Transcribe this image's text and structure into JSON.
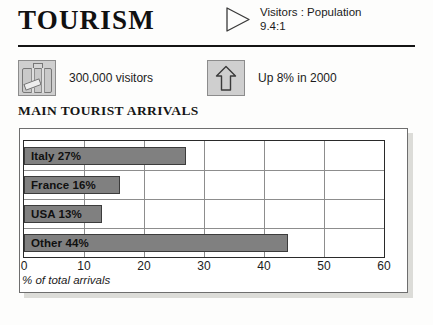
{
  "header": {
    "title": "TOURISM",
    "triangle_icon": "triangle-right-icon",
    "ratio_line1": "Visitors : Population",
    "ratio_line2": "9.4:1"
  },
  "stats": [
    {
      "icon": "suitcase-icon",
      "label": "300,000 visitors"
    },
    {
      "icon": "up-arrow-icon",
      "label": "Up 8% in 2000"
    }
  ],
  "chart_heading": "MAIN TOURIST ARRIVALS",
  "chart_data": {
    "type": "bar",
    "orientation": "horizontal",
    "title": "MAIN TOURIST ARRIVALS",
    "categories": [
      "Italy",
      "France",
      "USA",
      "Other"
    ],
    "values": [
      27,
      16,
      13,
      44
    ],
    "bar_labels": [
      "Italy 27%",
      "France 16%",
      "USA 13%",
      "Other 44%"
    ],
    "xlabel": "% of total arrivals",
    "ylabel": "",
    "xlim": [
      0,
      60
    ],
    "xticks": [
      0,
      10,
      20,
      30,
      40,
      50,
      60
    ],
    "xtick_labels": [
      "0",
      "10",
      "20",
      "30",
      "40",
      "50",
      "60"
    ],
    "grid": true,
    "legend": "none",
    "bar_color": "#808080",
    "bar_border_color": "#3c3c3c"
  },
  "colors": {
    "text": "#1b1b1b",
    "rule": "#141414",
    "icon_tile": "#cfcfcf",
    "panel_shadow": "#dcdcd8"
  }
}
